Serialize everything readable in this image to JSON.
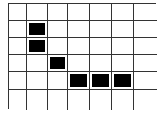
{
  "grid": {
    "rows": 6,
    "cols": 7,
    "line_color": "#333333",
    "fill_color": "#000000",
    "filled_cells": [
      {
        "row": 1,
        "col": 1
      },
      {
        "row": 2,
        "col": 1
      },
      {
        "row": 3,
        "col": 2
      },
      {
        "row": 4,
        "col": 3
      },
      {
        "row": 4,
        "col": 4
      },
      {
        "row": 4,
        "col": 5
      }
    ]
  }
}
